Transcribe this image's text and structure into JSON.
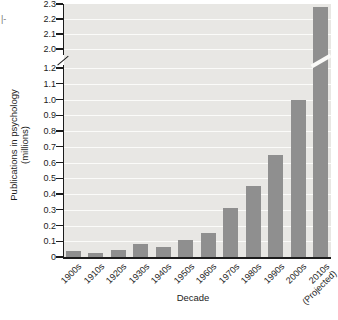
{
  "page": {
    "fragment_text": "|-"
  },
  "chart_data": {
    "type": "bar",
    "title": "",
    "xlabel": "Decade",
    "ylabel": "Publications in psychology",
    "ylabel_unit": "(millions)",
    "categories": [
      "1900s",
      "1910s",
      "1920s",
      "1930s",
      "1940s",
      "1950s",
      "1960s",
      "1970s",
      "1980s",
      "1990s",
      "2000s",
      "2010s (Projected)"
    ],
    "values": [
      0.035,
      0.025,
      0.045,
      0.085,
      0.065,
      0.105,
      0.15,
      0.31,
      0.45,
      0.65,
      1.0,
      2.28
    ],
    "ylim_lower_segment": [
      0,
      1.2
    ],
    "ylim_upper_segment": [
      2.0,
      2.3
    ],
    "axis_break_between": [
      1.2,
      2.0
    ],
    "ytick_labels_lower": [
      "0",
      "0.1",
      "0.2",
      "0.3",
      "0.4",
      "0.5",
      "0.6",
      "0.7",
      "0.8",
      "0.9",
      "1.0",
      "1.1",
      "1.2"
    ],
    "ytick_labels_upper": [
      "2.0",
      "2.1",
      "2.2",
      "2.3"
    ],
    "grid": true,
    "legend": false,
    "bar_color": "#8f8f8f",
    "plot_bg": "#e8e7e4",
    "gridline_color": "#fbfbf9",
    "axis_color": "#1c1c1c"
  }
}
